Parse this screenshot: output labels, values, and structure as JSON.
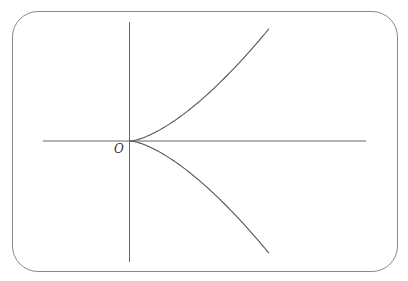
{
  "diagram": {
    "type": "semicubical-parabola",
    "equation": "y^2 = k x^3",
    "origin_label": "O",
    "colors": {
      "frame": "#8a8a8a",
      "axes": "#666666",
      "curve": "#555555"
    }
  }
}
